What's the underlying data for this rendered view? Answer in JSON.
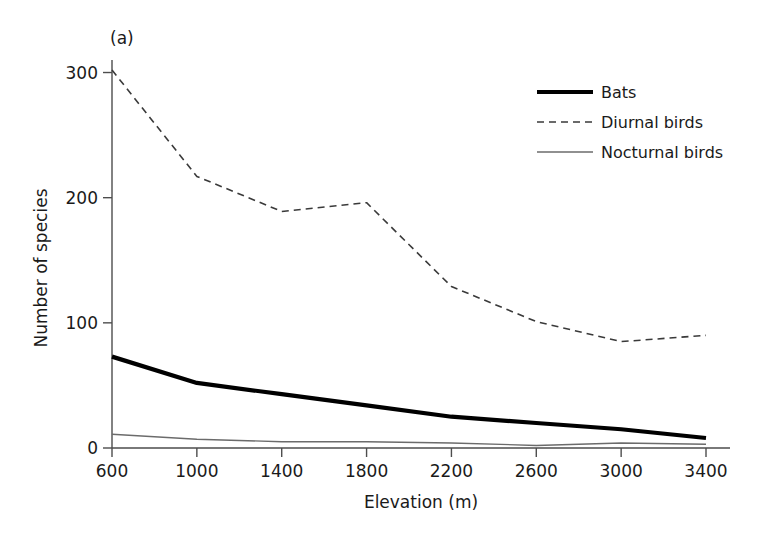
{
  "figure": {
    "panel_label": "(a)",
    "background_color": "#ffffff"
  },
  "chart_data": {
    "type": "line",
    "title": "",
    "subtitle": "",
    "panel_label": "(a)",
    "xlabel": "Elevation (m)",
    "ylabel": "Number of species",
    "x": [
      600,
      1000,
      1400,
      1800,
      2200,
      2600,
      3000,
      3400
    ],
    "xticks": [
      600,
      1000,
      1400,
      1800,
      2200,
      2600,
      3000,
      3400
    ],
    "xtick_labels": [
      "600",
      "1000",
      "1400",
      "1800",
      "2200",
      "2600",
      "3000",
      "3400"
    ],
    "yticks": [
      0,
      100,
      200,
      300
    ],
    "ytick_labels": [
      "0",
      "100",
      "200",
      "300"
    ],
    "xlim": [
      600,
      3400
    ],
    "ylim": [
      0,
      310
    ],
    "grid": false,
    "legend_position": "upper right",
    "series": [
      {
        "name": "Bats",
        "values": [
          73,
          52,
          43,
          34,
          25,
          20,
          15,
          8
        ],
        "style": "solid",
        "color": "#000000",
        "width": 4.2
      },
      {
        "name": "Diurnal birds",
        "values": [
          302,
          217,
          189,
          196,
          129,
          101,
          85,
          90
        ],
        "style": "dashed",
        "color": "#3a3a3a",
        "width": 1.6
      },
      {
        "name": "Nocturnal birds",
        "values": [
          11,
          7,
          5,
          5,
          4,
          2,
          4,
          3
        ],
        "style": "solid",
        "color": "#6b6b6b",
        "width": 1.3
      }
    ]
  },
  "legend": {
    "entries": [
      {
        "label": "Bats"
      },
      {
        "label": "Diurnal birds"
      },
      {
        "label": "Nocturnal birds"
      }
    ]
  }
}
